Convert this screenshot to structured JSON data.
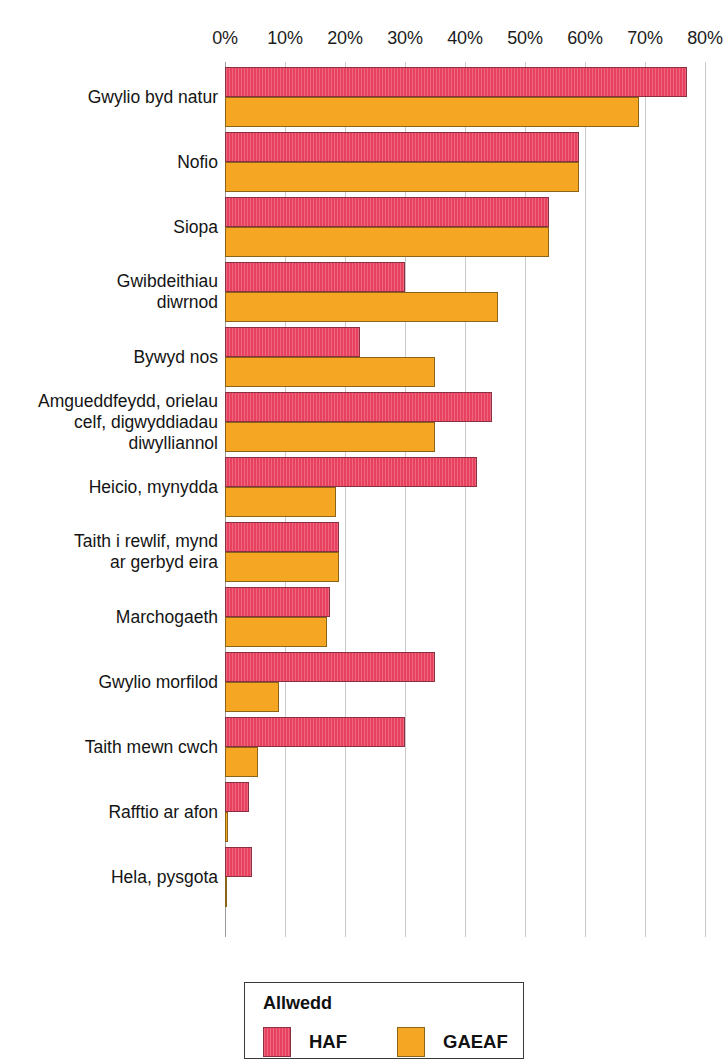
{
  "chart_data": {
    "type": "bar",
    "orientation": "horizontal",
    "title": "",
    "xlabel": "",
    "ylabel": "",
    "xlim": [
      0,
      80
    ],
    "xtick_labels": [
      "0%",
      "10%",
      "20%",
      "30%",
      "40%",
      "50%",
      "60%",
      "70%",
      "80%"
    ],
    "xticks": [
      0,
      10,
      20,
      30,
      40,
      50,
      60,
      70,
      80
    ],
    "grid": true,
    "value_suffix": "%",
    "legend_position": "bottom",
    "categories": [
      "Gwylio byd natur",
      "Nofio",
      "Siopa",
      "Gwibdeithiau\ndiwrnod",
      "Bywyd nos",
      "Amgueddfeydd, orielau\ncelf, digwyddiadau\ndiwylliannol",
      "Heicio, mynydda",
      "Taith i rewlif, mynd\nar gerbyd eira",
      "Marchogaeth",
      "Gwylio morfilod",
      "Taith mewn cwch",
      "Rafftio ar afon",
      "Hela, pysgota"
    ],
    "series": [
      {
        "name": "HAF",
        "color": "#e8415f",
        "values": [
          77,
          59,
          54,
          30,
          22.5,
          44.5,
          42,
          19,
          17.5,
          35,
          30,
          4,
          4.5
        ]
      },
      {
        "name": "GAEAF",
        "color": "#f5a623",
        "values": [
          69,
          59,
          54,
          45.5,
          35,
          35,
          18.5,
          19,
          17,
          9,
          5.5,
          0.5,
          0.4
        ]
      }
    ]
  },
  "legend": {
    "title": "Allwedd",
    "entries": [
      {
        "label": "HAF",
        "color": "#e8415f",
        "swatch_icon": "red-square-swatch-icon"
      },
      {
        "label": "GAEAF",
        "color": "#f5a623",
        "swatch_icon": "orange-square-swatch-icon"
      }
    ]
  }
}
